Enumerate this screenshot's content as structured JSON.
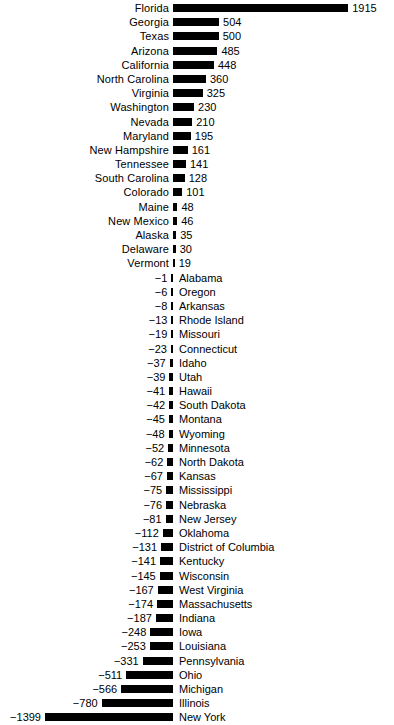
{
  "chart_data": {
    "type": "bar",
    "orientation": "horizontal",
    "title": "",
    "subtitle": "",
    "xlabel": "",
    "ylabel": "",
    "grid": false,
    "legend": null,
    "zero_axis": 0,
    "sorted": "descending",
    "xlim": [
      -1399,
      1915
    ],
    "value_label_format": "integer",
    "categories": [
      "Florida",
      "Georgia",
      "Texas",
      "Arizona",
      "California",
      "North Carolina",
      "Virginia",
      "Washington",
      "Nevada",
      "Maryland",
      "New Hampshire",
      "Tennessee",
      "South Carolina",
      "Colorado",
      "Maine",
      "New Mexico",
      "Alaska",
      "Delaware",
      "Vermont",
      "Alabama",
      "Oregon",
      "Arkansas",
      "Rhode Island",
      "Missouri",
      "Connecticut",
      "Idaho",
      "Utah",
      "Hawaii",
      "South Dakota",
      "Montana",
      "Wyoming",
      "Minnesota",
      "North Dakota",
      "Kansas",
      "Mississippi",
      "Nebraska",
      "New Jersey",
      "Oklahoma",
      "District of Columbia",
      "Kentucky",
      "Wisconsin",
      "West Virginia",
      "Massachusetts",
      "Indiana",
      "Iowa",
      "Louisiana",
      "Pennsylvania",
      "Ohio",
      "Michigan",
      "Illinois",
      "New York"
    ],
    "values": [
      1915,
      504,
      500,
      485,
      448,
      360,
      325,
      230,
      210,
      195,
      161,
      141,
      128,
      101,
      48,
      46,
      35,
      30,
      19,
      -1,
      -6,
      -8,
      -13,
      -19,
      -23,
      -37,
      -39,
      -41,
      -42,
      -45,
      -48,
      -52,
      -62,
      -67,
      -75,
      -76,
      -81,
      -112,
      -131,
      -141,
      -145,
      -167,
      -174,
      -187,
      -248,
      -253,
      -331,
      -511,
      -566,
      -780,
      -1399
    ],
    "value_labels": [
      "1915",
      "504",
      "500",
      "485",
      "448",
      "360",
      "325",
      "230",
      "210",
      "195",
      "161",
      "141",
      "128",
      "101",
      "48",
      "46",
      "35",
      "30",
      "19",
      "−1",
      "−6",
      "−8",
      "−13",
      "−19",
      "−23",
      "−37",
      "−39",
      "−41",
      "−42",
      "−45",
      "−48",
      "−52",
      "−62",
      "−67",
      "−75",
      "−76",
      "−81",
      "−112",
      "−131",
      "−141",
      "−145",
      "−167",
      "−174",
      "−187",
      "−248",
      "−253",
      "−331",
      "−511",
      "−566",
      "−780",
      "−1399"
    ],
    "bar_color": "#000000",
    "background_color": "#ffffff"
  },
  "caption": {
    "text": ""
  }
}
